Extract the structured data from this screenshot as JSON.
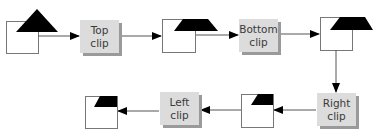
{
  "diagram": {
    "stages": [
      {
        "id": "top",
        "label_line1": "Top",
        "label_line2": "clip"
      },
      {
        "id": "bottom",
        "label_line1": "Bottom",
        "label_line2": "clip"
      },
      {
        "id": "right",
        "label_line1": "Right",
        "label_line2": "clip"
      },
      {
        "id": "left",
        "label_line1": "Left",
        "label_line2": "clip"
      }
    ],
    "colors": {
      "stage_fill": "#dcdcdc",
      "stage_shadow": "#9a9a9a",
      "shape_fill": "#000000",
      "box_stroke": "#777777",
      "arrow": "#555555"
    }
  }
}
